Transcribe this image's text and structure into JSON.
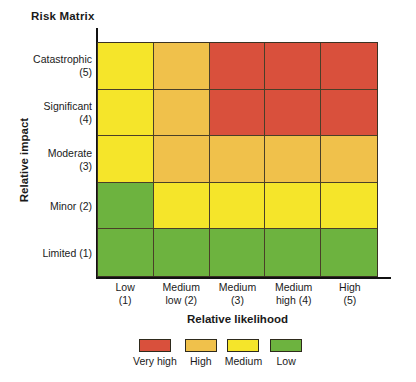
{
  "title": "Risk Matrix",
  "axes": {
    "x_title": "Relative likelihood",
    "y_title": "Relative impact"
  },
  "colors": {
    "very_high": "#d9503c",
    "high": "#f0c14b",
    "medium": "#f5e52a",
    "low": "#6db33f",
    "grid_line": "#4a3f28",
    "axis_line": "#111111",
    "text": "#1a1a1a",
    "background": "#ffffff"
  },
  "legend": {
    "items": [
      {
        "label": "Very high",
        "color": "#d9503c",
        "key": "very_high"
      },
      {
        "label": "High",
        "color": "#f0c14b",
        "key": "high"
      },
      {
        "label": "Medium",
        "color": "#f5e52a",
        "key": "medium"
      },
      {
        "label": "Low",
        "color": "#6db33f",
        "key": "low"
      }
    ]
  },
  "chart_data": {
    "type": "heatmap",
    "title": "Risk Matrix",
    "xlabel": "Relative likelihood",
    "ylabel": "Relative impact",
    "grid": true,
    "legend_position": "bottom",
    "x_categories": [
      {
        "line1": "Low",
        "line2": "(1)",
        "value": 1
      },
      {
        "line1": "Medium",
        "line2": "low (2)",
        "value": 2
      },
      {
        "line1": "Medium",
        "line2": "(3)",
        "value": 3
      },
      {
        "line1": "Medium",
        "line2": "high (4)",
        "value": 4
      },
      {
        "line1": "High",
        "line2": "(5)",
        "value": 5
      }
    ],
    "y_categories": [
      {
        "line1": "Catastrophic",
        "line2": "(5)",
        "value": 5
      },
      {
        "line1": "Significant",
        "line2": "(4)",
        "value": 4
      },
      {
        "line1": "Moderate",
        "line2": "(3)",
        "value": 3
      },
      {
        "line1": "Minor (2)",
        "line2": "",
        "value": 2
      },
      {
        "line1": "Limited (1)",
        "line2": "",
        "value": 1
      }
    ],
    "rating_scale": [
      "Very high",
      "High",
      "Medium",
      "Low"
    ],
    "rows": [
      {
        "impact": "Catastrophic (5)",
        "impact_value": 5,
        "cells": [
          {
            "likelihood": 1,
            "rating": "Medium",
            "color": "#f5e52a"
          },
          {
            "likelihood": 2,
            "rating": "High",
            "color": "#f0c14b"
          },
          {
            "likelihood": 3,
            "rating": "Very high",
            "color": "#d9503c"
          },
          {
            "likelihood": 4,
            "rating": "Very high",
            "color": "#d9503c"
          },
          {
            "likelihood": 5,
            "rating": "Very high",
            "color": "#d9503c"
          }
        ]
      },
      {
        "impact": "Significant (4)",
        "impact_value": 4,
        "cells": [
          {
            "likelihood": 1,
            "rating": "Medium",
            "color": "#f5e52a"
          },
          {
            "likelihood": 2,
            "rating": "High",
            "color": "#f0c14b"
          },
          {
            "likelihood": 3,
            "rating": "Very high",
            "color": "#d9503c"
          },
          {
            "likelihood": 4,
            "rating": "Very high",
            "color": "#d9503c"
          },
          {
            "likelihood": 5,
            "rating": "Very high",
            "color": "#d9503c"
          }
        ]
      },
      {
        "impact": "Moderate (3)",
        "impact_value": 3,
        "cells": [
          {
            "likelihood": 1,
            "rating": "Medium",
            "color": "#f5e52a"
          },
          {
            "likelihood": 2,
            "rating": "High",
            "color": "#f0c14b"
          },
          {
            "likelihood": 3,
            "rating": "High",
            "color": "#f0c14b"
          },
          {
            "likelihood": 4,
            "rating": "High",
            "color": "#f0c14b"
          },
          {
            "likelihood": 5,
            "rating": "High",
            "color": "#f0c14b"
          }
        ]
      },
      {
        "impact": "Minor (2)",
        "impact_value": 2,
        "cells": [
          {
            "likelihood": 1,
            "rating": "Low",
            "color": "#6db33f"
          },
          {
            "likelihood": 2,
            "rating": "Medium",
            "color": "#f5e52a"
          },
          {
            "likelihood": 3,
            "rating": "Medium",
            "color": "#f5e52a"
          },
          {
            "likelihood": 4,
            "rating": "Medium",
            "color": "#f5e52a"
          },
          {
            "likelihood": 5,
            "rating": "Medium",
            "color": "#f5e52a"
          }
        ]
      },
      {
        "impact": "Limited (1)",
        "impact_value": 1,
        "cells": [
          {
            "likelihood": 1,
            "rating": "Low",
            "color": "#6db33f"
          },
          {
            "likelihood": 2,
            "rating": "Low",
            "color": "#6db33f"
          },
          {
            "likelihood": 3,
            "rating": "Low",
            "color": "#6db33f"
          },
          {
            "likelihood": 4,
            "rating": "Low",
            "color": "#6db33f"
          },
          {
            "likelihood": 5,
            "rating": "Low",
            "color": "#6db33f"
          }
        ]
      }
    ]
  }
}
